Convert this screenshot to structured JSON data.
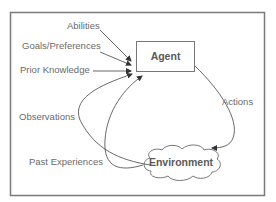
{
  "diagram": {
    "nodes": {
      "agent": {
        "label": "Agent"
      },
      "environment": {
        "label": "Environment"
      }
    },
    "inputs": {
      "abilities": "Abilities",
      "goals": "Goals/Preferences",
      "prior_knowledge": "Prior Knowledge"
    },
    "edges": {
      "actions": "Actions",
      "observations": "Observations",
      "past_experiences": "Past Experiences"
    },
    "colors": {
      "frame": "#7a7a7a",
      "line": "#555555",
      "text": "#6a6a6a"
    }
  }
}
